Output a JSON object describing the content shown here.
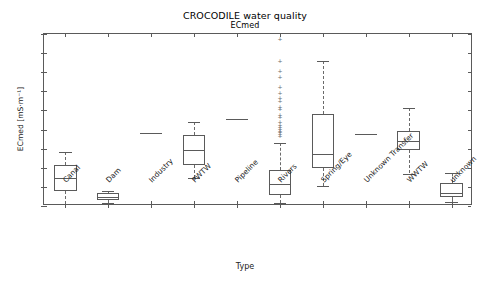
{
  "chart_data": {
    "type": "box",
    "title": "CROCODILE water quality",
    "subtitle": "ECmed",
    "xlabel": "Type",
    "ylabel": "ECmed [mS·m⁻¹]",
    "ylim": [
      0,
      180
    ],
    "yticks": [
      0,
      20,
      40,
      60,
      80,
      100,
      120,
      140,
      160,
      180
    ],
    "ytick_labels": [
      "0",
      "20",
      "40",
      "60",
      "80",
      "100",
      "120",
      "140",
      "160",
      "180"
    ],
    "grid": false,
    "legend": null,
    "categories": [
      "Canal",
      "Dam",
      "Industry",
      "PWTW",
      "Pipeline",
      "Rivers",
      "Spring/Eye",
      "Unknown Transfer",
      "WWTW",
      "unknown"
    ],
    "boxes": [
      {
        "label": "Canal",
        "whisker_low": 2,
        "q1": 16,
        "median": 29,
        "q3": 43,
        "whisker_high": 56,
        "fliers": [],
        "single_value": null
      },
      {
        "label": "Dam",
        "whisker_low": 3,
        "q1": 6,
        "median": 9,
        "q3": 14,
        "whisker_high": 16,
        "fliers": [],
        "single_value": null
      },
      {
        "label": "Industry",
        "whisker_low": null,
        "q1": null,
        "median": 76,
        "q3": null,
        "whisker_high": null,
        "fliers": [],
        "single_value": 76
      },
      {
        "label": "PWTW",
        "whisker_low": 29,
        "q1": 43,
        "median": 59,
        "q3": 74,
        "whisker_high": 88,
        "fliers": [],
        "single_value": null
      },
      {
        "label": "Pipeline",
        "whisker_low": null,
        "q1": null,
        "median": 91,
        "q3": null,
        "whisker_high": null,
        "fliers": [],
        "single_value": 91
      },
      {
        "label": "Rivers",
        "whisker_low": 3,
        "q1": 11,
        "median": 23,
        "q3": 38,
        "whisker_high": 66,
        "fliers": [
          175,
          152,
          141,
          135,
          125,
          118,
          113,
          110,
          104,
          101,
          95,
          93,
          88,
          85,
          83,
          81,
          79,
          77,
          75,
          73
        ],
        "single_value": null
      },
      {
        "label": "Spring/Eye",
        "whisker_low": 21,
        "q1": 40,
        "median": 54,
        "q3": 96,
        "whisker_high": 152,
        "fliers": [],
        "single_value": null
      },
      {
        "label": "Unknown Transfer",
        "whisker_low": null,
        "q1": null,
        "median": 75,
        "q3": null,
        "whisker_high": null,
        "fliers": [],
        "single_value": 75
      },
      {
        "label": "WWTW",
        "whisker_low": 34,
        "q1": 59,
        "median": 68,
        "q3": 78,
        "whisker_high": 103,
        "fliers": [],
        "single_value": null
      },
      {
        "label": "unknown",
        "whisker_low": 4,
        "q1": 9,
        "median": 14,
        "q3": 24,
        "whisker_high": 35,
        "fliers": [],
        "single_value": null
      }
    ],
    "colors": {
      "line": "#5a5a5a",
      "background": "#ffffff",
      "text": "#222222"
    }
  }
}
